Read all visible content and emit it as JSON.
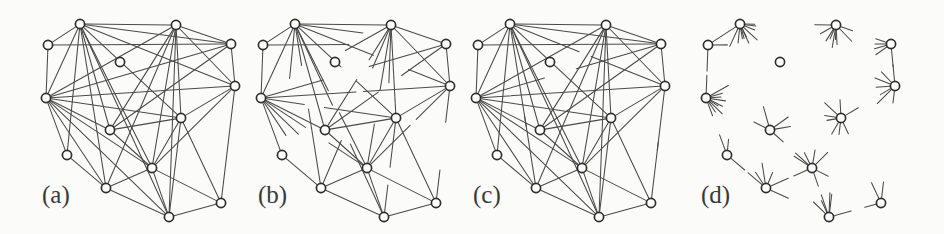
{
  "figure": {
    "caption_labels": [
      "(a)",
      "(b)",
      "(c)",
      "(d)"
    ],
    "background_color": "#fbfbfa",
    "edge_color": "#4a4a4a",
    "node_fill": "#ffffff",
    "node_stroke": "#2e2e2e",
    "node_radius": 4.6,
    "label_font_size": 25,
    "width": 944,
    "height": 234
  },
  "chart_data": {
    "type": "diagram",
    "title": "",
    "panels": [
      {
        "id": "a",
        "label": "(a)",
        "label_x": 42,
        "label_y": 203,
        "origin_x": 0,
        "edge_mode": "full",
        "edge_count": 41,
        "note": "all edges drawn end to end"
      },
      {
        "id": "b",
        "label": "(b)",
        "label_x": 258,
        "label_y": 203,
        "origin_x": 215,
        "edge_mode": "partial",
        "edge_count": 41,
        "note": "planar subset drawn fully, remaining edges drawn as partial stubs"
      },
      {
        "id": "c",
        "label": "(c)",
        "label_x": 473,
        "label_y": 203,
        "origin_x": 430,
        "edge_mode": "mostly-full",
        "edge_count": 41,
        "note": "most edges drawn fully, a few shortened"
      },
      {
        "id": "d",
        "label": "(d)",
        "label_x": 701,
        "label_y": 203,
        "origin_x": 660,
        "edge_mode": "stubs",
        "edge_count": 41,
        "note": "only short stubs at each vertex, one full edge retained"
      }
    ],
    "nodes": [
      {
        "id": 0,
        "x": 80,
        "y": 24
      },
      {
        "id": 1,
        "x": 176,
        "y": 25
      },
      {
        "id": 2,
        "x": 48,
        "y": 45
      },
      {
        "id": 3,
        "x": 231,
        "y": 44
      },
      {
        "id": 4,
        "x": 46,
        "y": 98
      },
      {
        "id": 5,
        "x": 235,
        "y": 86
      },
      {
        "id": 6,
        "x": 181,
        "y": 118
      },
      {
        "id": 7,
        "x": 110,
        "y": 130
      },
      {
        "id": 8,
        "x": 67,
        "y": 155
      },
      {
        "id": 9,
        "x": 152,
        "y": 168
      },
      {
        "id": 10,
        "x": 106,
        "y": 188
      },
      {
        "id": 11,
        "x": 221,
        "y": 203
      },
      {
        "id": 12,
        "x": 169,
        "y": 217
      },
      {
        "id": 13,
        "x": 120,
        "y": 62
      }
    ],
    "edges": [
      {
        "source": 0,
        "target": 1
      },
      {
        "source": 0,
        "target": 2
      },
      {
        "source": 0,
        "target": 3
      },
      {
        "source": 0,
        "target": 4
      },
      {
        "source": 0,
        "target": 5
      },
      {
        "source": 0,
        "target": 6
      },
      {
        "source": 0,
        "target": 7
      },
      {
        "source": 0,
        "target": 8
      },
      {
        "source": 0,
        "target": 9
      },
      {
        "source": 0,
        "target": 10
      },
      {
        "source": 0,
        "target": 12
      },
      {
        "source": 1,
        "target": 3
      },
      {
        "source": 1,
        "target": 4
      },
      {
        "source": 1,
        "target": 5
      },
      {
        "source": 1,
        "target": 6
      },
      {
        "source": 1,
        "target": 7
      },
      {
        "source": 1,
        "target": 9
      },
      {
        "source": 1,
        "target": 10
      },
      {
        "source": 1,
        "target": 12
      },
      {
        "source": 2,
        "target": 3
      },
      {
        "source": 2,
        "target": 4
      },
      {
        "source": 3,
        "target": 4
      },
      {
        "source": 3,
        "target": 5
      },
      {
        "source": 3,
        "target": 7
      },
      {
        "source": 4,
        "target": 5
      },
      {
        "source": 4,
        "target": 6
      },
      {
        "source": 4,
        "target": 7
      },
      {
        "source": 4,
        "target": 8
      },
      {
        "source": 4,
        "target": 9
      },
      {
        "source": 4,
        "target": 10
      },
      {
        "source": 4,
        "target": 12
      },
      {
        "source": 5,
        "target": 6
      },
      {
        "source": 5,
        "target": 9
      },
      {
        "source": 5,
        "target": 11
      },
      {
        "source": 6,
        "target": 7
      },
      {
        "source": 6,
        "target": 9
      },
      {
        "source": 6,
        "target": 11
      },
      {
        "source": 6,
        "target": 12
      },
      {
        "source": 7,
        "target": 9
      },
      {
        "source": 8,
        "target": 10
      },
      {
        "source": 9,
        "target": 10
      },
      {
        "source": 9,
        "target": 11
      },
      {
        "source": 9,
        "target": 12
      },
      {
        "source": 10,
        "target": 12
      },
      {
        "source": 11,
        "target": 12
      }
    ],
    "planar_edges": [
      [
        0,
        1
      ],
      [
        0,
        2
      ],
      [
        0,
        4
      ],
      [
        0,
        7
      ],
      [
        0,
        13
      ],
      [
        1,
        3
      ],
      [
        1,
        5
      ],
      [
        1,
        6
      ],
      [
        2,
        4
      ],
      [
        3,
        5
      ],
      [
        4,
        7
      ],
      [
        4,
        8
      ],
      [
        5,
        6
      ],
      [
        6,
        7
      ],
      [
        6,
        9
      ],
      [
        6,
        11
      ],
      [
        7,
        9
      ],
      [
        8,
        10
      ],
      [
        9,
        10
      ],
      [
        9,
        12
      ],
      [
        10,
        12
      ],
      [
        11,
        12
      ],
      [
        9,
        11
      ],
      [
        4,
        13
      ],
      [
        1,
        13
      ]
    ],
    "panel_d_full_edges": [
      [
        0,
        2
      ]
    ]
  }
}
